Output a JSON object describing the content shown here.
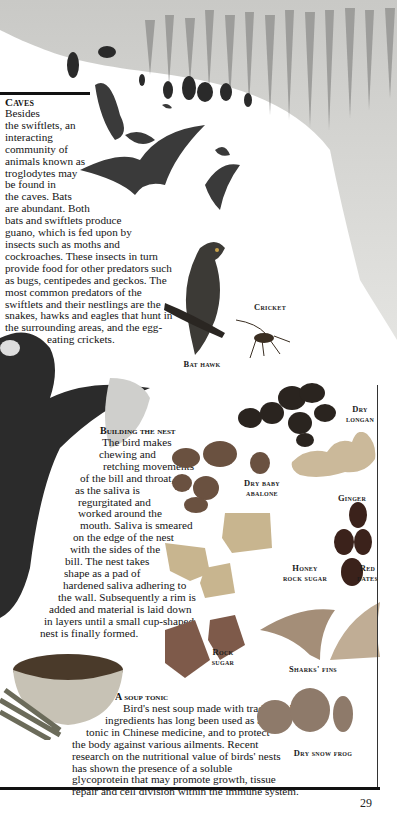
{
  "page": {
    "number": "29"
  },
  "caves": {
    "title": "Caves",
    "lines": [
      "Besides",
      "the swiftlets, an",
      "interacting",
      "community of",
      "animals known as",
      "troglodytes may",
      "be found in",
      "the caves. Bats",
      "are abundant. Both",
      "bats and swiftlets produce",
      "guano, which is fed upon by",
      "insects such as moths and",
      "cockroaches. These insects in turn",
      "provide food for other predators such",
      "as bugs, centipedes and geckos. The",
      "most common predators of the",
      "swiftlets and their nestlings are the",
      "snakes, hawks and eagles that hunt in",
      "the surrounding areas, and the egg-",
      "eating crickets."
    ]
  },
  "nest": {
    "title": "Building the nest",
    "lines": [
      "The bird makes",
      "chewing and",
      "retching movements",
      "of the bill and throat,",
      "as the saliva is",
      "regurgitated and",
      "worked around the",
      "mouth. Saliva is smeared",
      "on the edge of the nest",
      "with the sides of the",
      "bill. The nest takes",
      "shape as a pad of",
      "hardened saliva adhering to",
      "the wall. Subsequently a rim is",
      "added and material is laid down",
      "in layers until a small cup-shaped",
      "nest is finally formed."
    ]
  },
  "soup": {
    "title": "A soup tonic",
    "lines": [
      "Bird's nest soup made with traditional",
      "ingredients has long been used as a",
      "tonic in Chinese medicine, and to protect",
      "the body against various ailments. Recent",
      "research on the nutritional value of birds' nests",
      "has shown the presence of a soluble",
      "glycoprotein that may promote growth, tissue",
      "repair and cell division within the immune system."
    ]
  },
  "labels": {
    "cricket": "Cricket",
    "bat_hawk": "Bat hawk",
    "dry_longan": [
      "Dry",
      "longan"
    ],
    "dry_baby_abalone": [
      "Dry baby",
      "abalone"
    ],
    "ginger": "Ginger",
    "honey_rock_sugar": [
      "Honey",
      "rock sugar"
    ],
    "red_dates": [
      "Red",
      "dates"
    ],
    "rock_sugar": [
      "Rock",
      "sugar"
    ],
    "sharks_fins": "Sharks' fins",
    "dry_snow_frog": "Dry snow frog"
  }
}
